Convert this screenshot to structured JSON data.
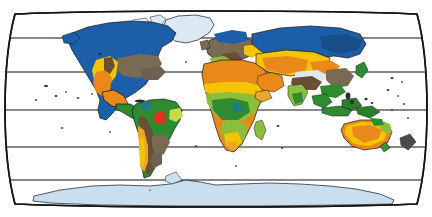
{
  "figure": {
    "name": "world-biome-map",
    "projection": "Robinson",
    "width": 432,
    "height": 217,
    "background_color": "#ffffff",
    "border_color": "#141414",
    "graticule_color": "#111111",
    "graticule_latitudes": [
      {
        "label": "60N",
        "y": 38
      },
      {
        "label": "30N",
        "y": 72
      },
      {
        "label": "0",
        "y": 110
      },
      {
        "label": "30S",
        "y": 147
      },
      {
        "label": "60S",
        "y": 180
      }
    ]
  },
  "legend_colors": {
    "boreal_forest_taiga": "#1C5FA8",
    "tundra_ice": "#C9DEEE",
    "temperate_forest": "#7A6A53",
    "grassland_steppe": "#F4C400",
    "desert": "#E8891A",
    "tropical_rainforest": "#2E8B30",
    "savanna": "#8BBE3C",
    "mountain_highland": "#6B4F35",
    "ocean": "#FFFFFF",
    "antarctic_ice": "#C9DEEE",
    "greenland_ice": "#DCE8F2",
    "marker_red": "#E03020",
    "marker_teal": "#1F7A86",
    "outline": "#161616"
  },
  "markers": [
    {
      "name": "site-marker-amazon",
      "color": "#E03020",
      "shape": "circle",
      "x": 160,
      "y": 118,
      "radius": 6.2,
      "region": "Amazon Basin, South America"
    },
    {
      "name": "site-marker-northern-south-america",
      "color": "#1F7A86",
      "shape": "circle",
      "x": 146,
      "y": 106,
      "radius": 5.0,
      "region": "Northern South America"
    }
  ],
  "continents": [
    {
      "name": "north-america",
      "label": "North America"
    },
    {
      "name": "south-america",
      "label": "South America"
    },
    {
      "name": "europe",
      "label": "Europe"
    },
    {
      "name": "africa",
      "label": "Africa"
    },
    {
      "name": "asia",
      "label": "Asia"
    },
    {
      "name": "australia",
      "label": "Australia"
    },
    {
      "name": "antarctica",
      "label": "Antarctica"
    },
    {
      "name": "greenland",
      "label": "Greenland"
    }
  ]
}
